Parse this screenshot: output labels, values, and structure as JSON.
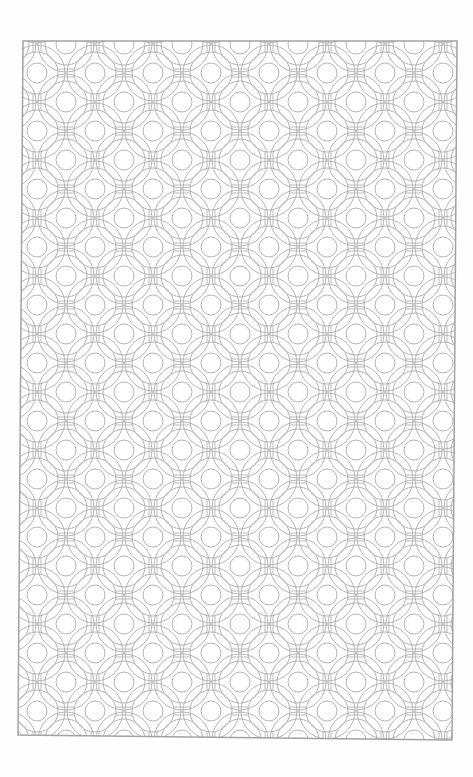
{
  "page": {
    "background_color": "#ffffff",
    "line_color": "#b4b4b4",
    "border_color": "#a2a2a2"
  },
  "frame": {
    "top_left": [
      23,
      41
    ],
    "top_right": [
      457,
      41
    ],
    "bottom_right": [
      452,
      740
    ],
    "bottom_left": [
      18,
      735
    ]
  },
  "pattern": {
    "type": "overlapping concentric circles on staggered lattice",
    "period_px": 58,
    "inner_circle_radius": 10,
    "middle_circle_radius": 21,
    "outer_circle_radius": 28,
    "anchor_circle_center": [
      240,
      218
    ]
  }
}
